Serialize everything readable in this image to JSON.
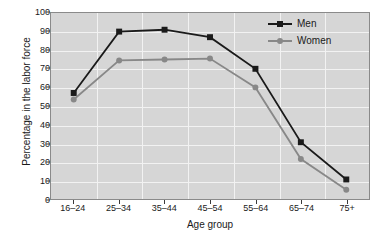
{
  "chart_data": {
    "type": "line",
    "title": "",
    "xlabel": "Age group",
    "ylabel": "Percentage in the labor force",
    "categories": [
      "16–24",
      "25–34",
      "35–44",
      "45–54",
      "55–64",
      "65–74",
      "75+"
    ],
    "ylim": [
      0,
      100
    ],
    "yticks": [
      0,
      10,
      20,
      30,
      40,
      50,
      60,
      70,
      80,
      90,
      100
    ],
    "ytick_labels": [
      "0",
      "10",
      "20",
      "30",
      "40",
      "50",
      "60",
      "70",
      "80",
      "90",
      "100"
    ],
    "grid": true,
    "grid_color": "#f2f2f2",
    "plot_background": "#d6d6d6",
    "legend_position": "top-right",
    "series": [
      {
        "name": "Men",
        "color": "#1a1a1a",
        "marker": "square",
        "values": [
          57,
          90,
          91,
          87,
          70,
          30.5,
          10.5
        ]
      },
      {
        "name": "Women",
        "color": "#888888",
        "marker": "circle",
        "values": [
          53.5,
          74.5,
          75,
          75.5,
          60,
          21.5,
          5
        ]
      }
    ]
  },
  "legend": {
    "entries": [
      {
        "label": "Men"
      },
      {
        "label": "Women"
      }
    ]
  }
}
